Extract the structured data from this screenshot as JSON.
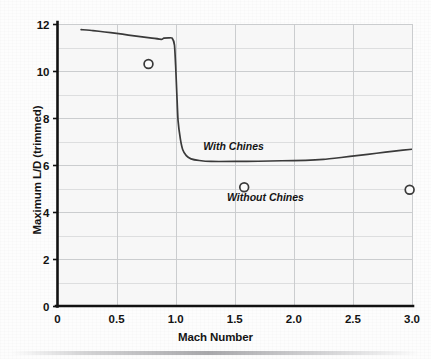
{
  "chart_data": {
    "type": "line",
    "title": "",
    "subtitle": "",
    "xlabel": "Mach Number",
    "ylabel": "Maximum L/D (trimmed)",
    "xlim": [
      0,
      3.0
    ],
    "ylim": [
      0,
      12
    ],
    "x_ticks": [
      0,
      0.5,
      1.0,
      1.5,
      2.0,
      2.5,
      3.0
    ],
    "x_tick_labels": [
      "0",
      "0.5",
      "1.0",
      "1.5",
      "2.0",
      "2.5",
      "3.0"
    ],
    "y_ticks": [
      0,
      2,
      4,
      6,
      8,
      10,
      12
    ],
    "y_tick_labels": [
      "0",
      "2",
      "4",
      "6",
      "8",
      "10",
      "12"
    ],
    "y_gridline_step": 1,
    "x_gridline_step": 0.5,
    "grid": true,
    "grid_color": "#c9cbcd",
    "axis_color": "#121212",
    "plot_background": "#f7f7f7",
    "legend_position": "inline-annotations",
    "series": [
      {
        "name": "With Chines",
        "type": "line",
        "color": "#3a3a3a",
        "line_width": 1.7,
        "points": [
          [
            0.2,
            11.76
          ],
          [
            0.3,
            11.72
          ],
          [
            0.4,
            11.66
          ],
          [
            0.5,
            11.6
          ],
          [
            0.6,
            11.53
          ],
          [
            0.7,
            11.46
          ],
          [
            0.8,
            11.4
          ],
          [
            0.88,
            11.35
          ],
          [
            0.9,
            11.4
          ],
          [
            0.94,
            11.41
          ],
          [
            0.97,
            11.4
          ],
          [
            0.99,
            11.1
          ],
          [
            1.0,
            10.2
          ],
          [
            1.01,
            9.0
          ],
          [
            1.02,
            7.9
          ],
          [
            1.04,
            7.1
          ],
          [
            1.06,
            6.65
          ],
          [
            1.09,
            6.4
          ],
          [
            1.13,
            6.26
          ],
          [
            1.2,
            6.19
          ],
          [
            1.3,
            6.15
          ],
          [
            1.5,
            6.15
          ],
          [
            1.7,
            6.16
          ],
          [
            1.9,
            6.18
          ],
          [
            2.1,
            6.2
          ],
          [
            2.25,
            6.24
          ],
          [
            2.4,
            6.32
          ],
          [
            2.55,
            6.41
          ],
          [
            2.7,
            6.5
          ],
          [
            2.85,
            6.59
          ],
          [
            3.0,
            6.67
          ]
        ]
      },
      {
        "name": "Without Chines",
        "type": "scatter",
        "marker": "open-circle",
        "color": "#3a3a3a",
        "points": [
          [
            0.77,
            10.3
          ],
          [
            1.58,
            5.05
          ],
          [
            2.98,
            4.95
          ]
        ]
      }
    ],
    "annotations": [
      {
        "text": "With Chines",
        "x": 1.49,
        "y": 6.62,
        "style": "bold-italic"
      },
      {
        "text": "Without Chines",
        "x": 1.76,
        "y": 4.48,
        "style": "bold-italic"
      }
    ]
  }
}
